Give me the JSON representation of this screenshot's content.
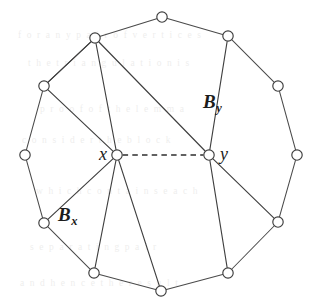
{
  "figure": {
    "background_color": "#ffffff",
    "edge_color": "#4a4a4a",
    "node_fill": "#ffffff",
    "node_stroke": "#3d3d3d",
    "width": 322,
    "height": 308
  },
  "labels": {
    "x": "x",
    "y": "y",
    "By_base": "B",
    "By_sub": "y",
    "Bx_base": "B",
    "Bx_sub": "x"
  },
  "chart_data": {
    "type": "diagram",
    "vertices": [
      {
        "id": "v0",
        "label": "",
        "x": 162,
        "y": 17,
        "ring": true
      },
      {
        "id": "v1",
        "label": "",
        "x": 228,
        "y": 36,
        "ring": true
      },
      {
        "id": "v2",
        "label": "",
        "x": 278,
        "y": 86,
        "ring": true
      },
      {
        "id": "v3",
        "label": "",
        "x": 297,
        "y": 155,
        "ring": true
      },
      {
        "id": "v4",
        "label": "",
        "x": 278,
        "y": 222,
        "ring": true
      },
      {
        "id": "v5",
        "label": "",
        "x": 228,
        "y": 273,
        "ring": true
      },
      {
        "id": "v6",
        "label": "",
        "x": 161,
        "y": 291,
        "ring": true
      },
      {
        "id": "v7",
        "label": "",
        "x": 94,
        "y": 273,
        "ring": true
      },
      {
        "id": "v8",
        "label": "",
        "x": 44,
        "y": 223,
        "ring": true
      },
      {
        "id": "v9",
        "label": "",
        "x": 25,
        "y": 155,
        "ring": true
      },
      {
        "id": "v10",
        "label": "",
        "x": 44,
        "y": 86,
        "ring": true
      },
      {
        "id": "v11",
        "label": "",
        "x": 95,
        "y": 38,
        "ring": true
      },
      {
        "id": "x",
        "label": "x",
        "x": 117,
        "y": 155,
        "ring": false
      },
      {
        "id": "y",
        "label": "y",
        "x": 209,
        "y": 155,
        "ring": false
      }
    ],
    "ring_edges": [
      [
        "v0",
        "v1"
      ],
      [
        "v1",
        "v2"
      ],
      [
        "v2",
        "v3"
      ],
      [
        "v3",
        "v4"
      ],
      [
        "v4",
        "v5"
      ],
      [
        "v5",
        "v6"
      ],
      [
        "v6",
        "v7"
      ],
      [
        "v7",
        "v8"
      ],
      [
        "v8",
        "v9"
      ],
      [
        "v9",
        "v10"
      ],
      [
        "v10",
        "v11"
      ],
      [
        "v11",
        "v0"
      ]
    ],
    "chords": [
      [
        "v11",
        "v10"
      ],
      [
        "v11",
        "x"
      ],
      [
        "v11",
        "y"
      ],
      [
        "v1",
        "y"
      ],
      [
        "x",
        "v10"
      ],
      [
        "x",
        "v8"
      ],
      [
        "x",
        "v7"
      ],
      [
        "x",
        "v6"
      ],
      [
        "y",
        "v5"
      ],
      [
        "y",
        "v4"
      ]
    ],
    "dashed_edges": [
      [
        "x",
        "y"
      ]
    ],
    "regions": [
      {
        "name": "B_y",
        "label_x": 203,
        "label_y": 92,
        "note": "upper-right region bounded by v1, v2, v3, v4, v5, y"
      },
      {
        "name": "B_x",
        "label_x": 58,
        "label_y": 205,
        "note": "lower-left region adjacent to x"
      }
    ],
    "node_radius": 5.2
  },
  "ghost_text": {
    "lines": [
      {
        "text": "f  o  r    a  n  y    p  a  i  r    o  f    v  e  r  t  i  c  e  s",
        "x": 18,
        "y": 30
      },
      {
        "text": "t  h  e    t  r  i  a  n  g  u  l  a  t  i  o  n    i  s",
        "x": 28,
        "y": 58
      },
      {
        "text": "p  r  o  o  f    o  f    t  h  e    l  e  m  m  a",
        "x": 40,
        "y": 104
      },
      {
        "text": "c  o  n  s  i  d  e  r    t  h  e    b  l  o  c  k",
        "x": 22,
        "y": 135
      },
      {
        "text": "w  h  i  c  h    c  o  n  t  a  i  n  s    e  a  c  h",
        "x": 36,
        "y": 186
      },
      {
        "text": "s  e  p  a  r  a  t  i  n  g    p  a  i  r",
        "x": 30,
        "y": 242
      },
      {
        "text": "a  n  d    h  e  n  c  e    t  h  e    r  e  s  u  l  t",
        "x": 20,
        "y": 278
      }
    ]
  }
}
